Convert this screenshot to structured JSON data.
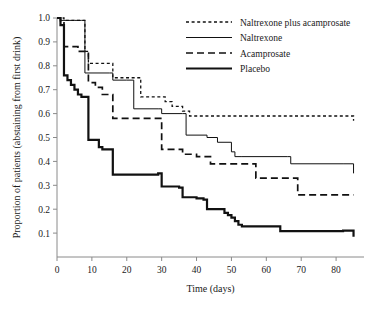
{
  "chart_data": {
    "type": "line",
    "title": "",
    "xlabel": "Time (days)",
    "ylabel": "Proportion of patients (abstaining from first drink)",
    "xlim": [
      0,
      88
    ],
    "ylim": [
      0,
      1.0
    ],
    "grid": false,
    "legend_position": "top-right",
    "xticks": [
      0,
      10,
      20,
      30,
      40,
      50,
      60,
      70,
      80
    ],
    "xticklabels": [
      "0",
      "10",
      "20",
      "30",
      "40",
      "50",
      "60",
      "70",
      "80"
    ],
    "yticks": [
      0.1,
      0.2,
      0.3,
      0.4,
      0.5,
      0.6,
      0.7,
      0.8,
      0.9,
      1.0
    ],
    "yticklabels": [
      "0.1",
      "0.2",
      "0.3",
      "0.4",
      "0.5",
      "0.6",
      "0.7",
      "0.8",
      "0.9",
      "1.0"
    ],
    "interpolation": "step-after",
    "series": [
      {
        "name": "Naltrexone plus acamprosate",
        "line_style": "dotted",
        "line_width": 1.3,
        "color": "#111111",
        "final_value": 0.57,
        "x": [
          0,
          1,
          2,
          7,
          8,
          9,
          12,
          15,
          16,
          22,
          24,
          29,
          31,
          33,
          36,
          38,
          44,
          85
        ],
        "y": [
          1.0,
          1.0,
          0.99,
          0.99,
          0.86,
          0.81,
          0.81,
          0.81,
          0.75,
          0.75,
          0.67,
          0.67,
          0.65,
          0.63,
          0.61,
          0.59,
          0.59,
          0.57
        ]
      },
      {
        "name": "Naltrexone",
        "line_style": "solid-thin",
        "line_width": 1.0,
        "color": "#111111",
        "final_value": 0.35,
        "x": [
          0,
          1,
          2,
          5,
          7,
          8,
          15,
          16,
          20,
          22,
          29,
          30,
          36,
          37,
          43,
          46,
          50,
          51,
          53,
          66,
          67,
          82,
          85
        ],
        "y": [
          1.0,
          0.99,
          0.99,
          0.99,
          0.99,
          0.77,
          0.77,
          0.74,
          0.74,
          0.62,
          0.62,
          0.6,
          0.6,
          0.51,
          0.5,
          0.48,
          0.44,
          0.42,
          0.42,
          0.42,
          0.39,
          0.39,
          0.35
        ]
      },
      {
        "name": "Acamprosate",
        "line_style": "dashed",
        "line_width": 1.7,
        "color": "#111111",
        "final_value": 0.26,
        "x": [
          0,
          1,
          2,
          4,
          6,
          8,
          9,
          11,
          13,
          15,
          16,
          29,
          30,
          33,
          36,
          40,
          43,
          44,
          56,
          57,
          68,
          69,
          85
        ],
        "y": [
          1.0,
          0.98,
          0.88,
          0.88,
          0.86,
          0.86,
          0.73,
          0.71,
          0.68,
          0.68,
          0.58,
          0.58,
          0.45,
          0.45,
          0.43,
          0.42,
          0.42,
          0.39,
          0.39,
          0.33,
          0.33,
          0.26,
          0.26
        ]
      },
      {
        "name": "Placebo",
        "line_style": "solid-thick",
        "line_width": 2.2,
        "color": "#111111",
        "final_value": 0.085,
        "x": [
          0,
          1,
          2,
          3,
          4,
          5,
          6,
          7,
          8,
          9,
          11,
          12,
          13,
          14,
          15,
          16,
          22,
          28,
          29,
          30,
          33,
          35,
          36,
          38,
          40,
          42,
          43,
          46,
          48,
          49,
          50,
          51,
          52,
          53,
          63,
          64,
          81,
          82,
          85
        ],
        "y": [
          1.0,
          0.97,
          0.76,
          0.74,
          0.72,
          0.7,
          0.68,
          0.67,
          0.67,
          0.49,
          0.49,
          0.46,
          0.45,
          0.45,
          0.45,
          0.345,
          0.345,
          0.345,
          0.35,
          0.295,
          0.295,
          0.29,
          0.25,
          0.25,
          0.245,
          0.24,
          0.2,
          0.2,
          0.185,
          0.175,
          0.165,
          0.15,
          0.135,
          0.128,
          0.128,
          0.108,
          0.108,
          0.11,
          0.085
        ]
      }
    ]
  },
  "legend": {
    "items": [
      {
        "label": "Naltrexone plus acamprosate",
        "style": "dotted"
      },
      {
        "label": "Naltrexone",
        "style": "solid-thin"
      },
      {
        "label": "Acamprosate",
        "style": "dashed"
      },
      {
        "label": "Placebo",
        "style": "solid-thick"
      }
    ]
  }
}
